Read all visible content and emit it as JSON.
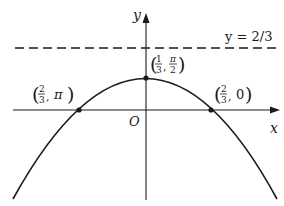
{
  "diagram": {
    "type": "polar-curve-graph",
    "axes": {
      "x_label": "x",
      "y_label": "y",
      "origin_label": "O"
    },
    "asymptote": {
      "label": "y = 2/3",
      "style": "dashed"
    },
    "points": [
      {
        "id": "vertex",
        "label_num_1": "1",
        "label_den_1": "3",
        "label_num_2": "π",
        "label_den_2": "2",
        "text": "(1/3, π/2)"
      },
      {
        "id": "left-intercept",
        "label_num_1": "2",
        "label_den_1": "3",
        "label_second": "π",
        "text": "(2/3, π)"
      },
      {
        "id": "right-intercept",
        "label_num_1": "2",
        "label_den_1": "3",
        "label_second": "0",
        "text": "(2/3, 0)"
      }
    ],
    "colors": {
      "ink": "#1a1a1a",
      "background": "#ffffff"
    }
  }
}
